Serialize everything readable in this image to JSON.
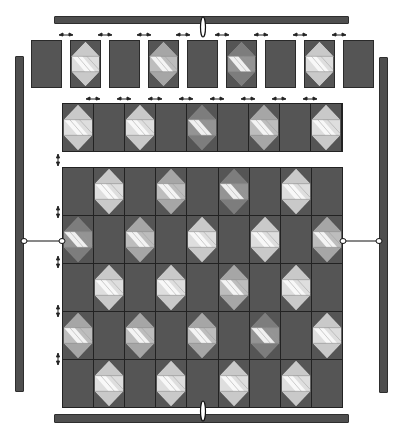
{
  "diagram": {
    "type": "quilt-assembly",
    "colors": {
      "background": "#ffffff",
      "block_dark": "#555555",
      "border_bar": "#4f4f4f",
      "grid_line": "#222222",
      "shade_light": {
        "tri": "#c9c9c9",
        "side": "#dedede",
        "stripe": "#f8f8f8"
      },
      "shade_medium": {
        "tri": "#a6a6a6",
        "side": "#bdbdbd",
        "stripe": "#f4f4f4"
      },
      "shade_dark": {
        "tri": "#7d7d7d",
        "side": "#949494",
        "stripe": "#f0f0f0"
      }
    },
    "top_row": {
      "blocks": [
        "P",
        "L",
        "P",
        "M",
        "P",
        "K",
        "P",
        "L",
        "P"
      ]
    },
    "second_row": {
      "blocks": [
        "L",
        "P",
        "L",
        "P",
        "K",
        "P",
        "M",
        "P",
        "L"
      ]
    },
    "main_grid": {
      "rows": 5,
      "cols": 9,
      "cells": [
        [
          "P",
          "L",
          "P",
          "M",
          "P",
          "K",
          "P",
          "L",
          "P"
        ],
        [
          "K",
          "P",
          "M",
          "P",
          "L",
          "P",
          "L",
          "P",
          "M"
        ],
        [
          "P",
          "L",
          "P",
          "L",
          "P",
          "M",
          "P",
          "L",
          "P"
        ],
        [
          "M",
          "P",
          "M",
          "P",
          "M",
          "P",
          "K",
          "P",
          "L"
        ],
        [
          "P",
          "L",
          "P",
          "L",
          "P",
          "L",
          "P",
          "L",
          "P"
        ]
      ]
    },
    "borders": [
      "top",
      "bottom",
      "left",
      "right"
    ]
  }
}
